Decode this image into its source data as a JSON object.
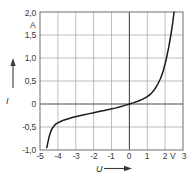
{
  "chart_data": {
    "type": "line",
    "title": "",
    "xlabel": "U",
    "ylabel": "I",
    "xunit": "V",
    "yunit": "A",
    "xlim": [
      -5,
      3
    ],
    "ylim": [
      -1.0,
      2.0
    ],
    "grid": true,
    "legend": false,
    "decimal_separator": ",",
    "xticks": [
      -5,
      -4,
      -3,
      -2,
      -1,
      0,
      1,
      2,
      3
    ],
    "xticklabels": [
      "-5",
      "-4",
      "-3",
      "-2",
      "-1",
      "0",
      "1",
      "2",
      "3"
    ],
    "yticks": [
      -1.0,
      -0.5,
      0,
      0.5,
      1.0,
      1.5,
      2.0
    ],
    "yticklabels": [
      "-1,0",
      "-0,5",
      "0",
      "0,5",
      "1,0",
      "1,5",
      "2,0"
    ],
    "series": [
      {
        "name": "I(U)",
        "x": [
          -4.62,
          -4.55,
          -4.48,
          -4.4,
          -4.3,
          -4.2,
          -4.1,
          -4.0,
          -3.85,
          -3.7,
          -3.5,
          -3.2,
          -2.9,
          -2.6,
          -2.3,
          -2.0,
          -1.7,
          -1.4,
          -1.1,
          -0.8,
          -0.5,
          -0.25,
          0.0,
          0.25,
          0.5,
          0.75,
          1.0,
          1.2,
          1.4,
          1.6,
          1.75,
          1.9,
          2.05,
          2.2,
          2.32,
          2.42,
          2.5
        ],
        "y": [
          -0.95,
          -0.82,
          -0.7,
          -0.6,
          -0.52,
          -0.47,
          -0.43,
          -0.41,
          -0.38,
          -0.355,
          -0.33,
          -0.295,
          -0.265,
          -0.24,
          -0.215,
          -0.19,
          -0.165,
          -0.14,
          -0.115,
          -0.09,
          -0.06,
          -0.03,
          0.0,
          0.03,
          0.065,
          0.105,
          0.16,
          0.22,
          0.31,
          0.44,
          0.56,
          0.73,
          0.95,
          1.23,
          1.5,
          1.75,
          2.0
        ]
      }
    ],
    "annotations": {
      "x_axis_arrow": "right-arrow",
      "y_axis_arrow": "up-arrow"
    },
    "colors": {
      "curve": "#1a1a1a",
      "grid": "#9b9b9b",
      "axis": "#4a4a4a",
      "frame": "#6e6e6e",
      "text": "#3a3a3a",
      "background": "#ffffff"
    }
  },
  "axes": {
    "y_title": "I",
    "x_title": "U",
    "y_unit": "A",
    "x_unit": "V"
  },
  "yticklabels": {
    "t0": "2,0",
    "t1": "1,5",
    "t2": "1,0",
    "t3": "0,5",
    "t4": "0",
    "t5": "-0,5",
    "t6": "-1,0"
  },
  "xticklabels": {
    "t0": "-5",
    "t1": "-4",
    "t2": "-3",
    "t3": "-2",
    "t4": "-1",
    "t5": "0",
    "t6": "1",
    "t7": "2",
    "t8": "3"
  }
}
